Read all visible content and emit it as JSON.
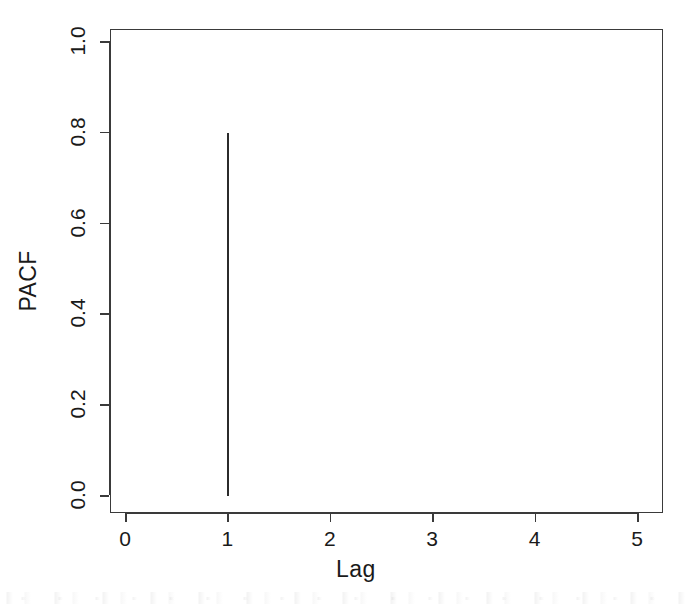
{
  "chart_data": {
    "type": "bar",
    "title": "",
    "subtitle": "",
    "xlabel": "Lag",
    "ylabel": "PACF",
    "x": [
      0,
      1,
      2,
      3,
      4,
      5
    ],
    "values": [
      0,
      0.8,
      0,
      0,
      0,
      0
    ],
    "series": [
      {
        "name": "PACF",
        "values": [
          0,
          0.8,
          0,
          0,
          0,
          0
        ]
      }
    ],
    "points": [
      {
        "lag": 1,
        "pacf": 0.8
      }
    ],
    "xlim": [
      -0.15,
      5.25
    ],
    "ylim": [
      -0.03,
      1.05
    ],
    "xticks": [
      0,
      1,
      2,
      3,
      4,
      5
    ],
    "yticks": [
      0.0,
      0.2,
      0.4,
      0.6,
      0.8,
      1.0
    ],
    "xticklabels": [
      "0",
      "1",
      "2",
      "3",
      "4",
      "5"
    ],
    "yticklabels": [
      "0.0",
      "0.2",
      "0.4",
      "0.6",
      "0.8",
      "1.0"
    ],
    "grid": false,
    "legend": null,
    "legend_position": "none",
    "annotations": [],
    "line_color": "#2b2b2b",
    "axis_color": "#3a3a3a",
    "background_color": "#ffffff",
    "text_color": "#1a1a1a"
  },
  "axes": {
    "y_title": "PACF",
    "x_title": "Lag",
    "y_tick_labels": [
      "0.0",
      "0.2",
      "0.4",
      "0.6",
      "0.8",
      "1.0"
    ],
    "x_tick_labels": [
      "0",
      "1",
      "2",
      "3",
      "4",
      "5"
    ]
  }
}
